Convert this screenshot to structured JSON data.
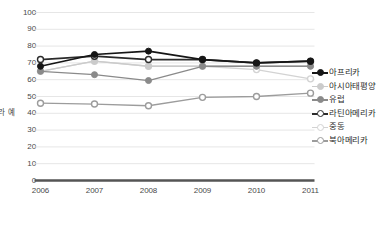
{
  "chart_data": {
    "type": "line",
    "title": "",
    "subtitle": "",
    "xlabel": "",
    "ylabel": "예\n라\n고\n응\n답\n한\n비\n율",
    "ylabel_text": "예라고 응답한 비율",
    "x": [
      "2006",
      "2007",
      "2008",
      "2009",
      "2010",
      "2011"
    ],
    "xtick_labels": [
      "2006",
      "2007",
      "2008",
      "2009",
      "2010",
      "2011"
    ],
    "ytick_labels": [
      "0",
      "10",
      "20",
      "30",
      "40",
      "50",
      "60",
      "70",
      "80",
      "90",
      "100"
    ],
    "ytick_values": [
      0,
      10,
      20,
      30,
      40,
      50,
      60,
      70,
      80,
      90,
      100
    ],
    "ylim": [
      0,
      100
    ],
    "grid": true,
    "grid_axis": "y",
    "legend_position": "right",
    "series": [
      {
        "name": "아프리카",
        "marker": "filled-circle",
        "color": "#161616",
        "values": [
          68,
          75,
          77,
          72,
          70,
          71
        ]
      },
      {
        "name": "아시아태평양",
        "marker": "filled-circle",
        "color": "#cbcbcb",
        "values": [
          65,
          71,
          68,
          68,
          68,
          68
        ]
      },
      {
        "name": "유럽",
        "marker": "filled-circle",
        "color": "#8a8a8a",
        "values": [
          65,
          63,
          59.5,
          68,
          68,
          68
        ]
      },
      {
        "name": "라틴아메리카",
        "marker": "open-circle",
        "color": "#2b2b2b",
        "values": [
          72,
          74,
          72,
          72,
          70,
          71
        ]
      },
      {
        "name": "중동",
        "marker": "open-circle",
        "color": "#d3d3d3",
        "values": [
          65,
          71,
          68,
          68,
          66,
          60.5
        ]
      },
      {
        "name": "북아메리카",
        "marker": "open-circle",
        "color": "#9c9c9c",
        "values": [
          46,
          45.5,
          44.5,
          49.5,
          50,
          52
        ]
      }
    ]
  },
  "colors": {
    "grid": "#e3e3e3",
    "axis": "#4a4a4a",
    "text": "#3a3a3a",
    "background": "#ffffff"
  }
}
